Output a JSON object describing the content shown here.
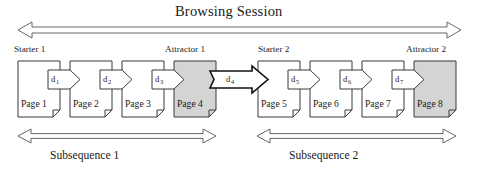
{
  "diagram": {
    "title": "Browsing Session",
    "session_arrow": {
      "name": "browsing-session-span-arrow",
      "direction": "double",
      "x1": 18,
      "x2": 461,
      "y": 30
    },
    "style": {
      "stroke": "#3a3a3a",
      "fill_plain": "#ffffff",
      "fill_shaded": "#d4d4d4",
      "bold_stroke": "#111111"
    },
    "role_labels": [
      {
        "name": "starter-1-label",
        "text": "Starter 1",
        "x": 14,
        "y": 46
      },
      {
        "name": "attractor-1-label",
        "text": "Attractor 1",
        "x": 168,
        "y": 46
      },
      {
        "name": "starter-2-label",
        "text": "Starter 2",
        "x": 259,
        "y": 46
      },
      {
        "name": "attractor-2-label",
        "text": "Attractor 2",
        "x": 411,
        "y": 46
      }
    ],
    "pages": [
      {
        "name": "page-node-1",
        "label": "Page 1",
        "x": 18,
        "y": 61,
        "w": 42,
        "h": 56,
        "shaded": false,
        "role": "Starter 1"
      },
      {
        "name": "page-node-2",
        "label": "Page 2",
        "x": 70,
        "y": 61,
        "w": 42,
        "h": 56,
        "shaded": false,
        "role": ""
      },
      {
        "name": "page-node-3",
        "label": "Page 3",
        "x": 122,
        "y": 61,
        "w": 42,
        "h": 56,
        "shaded": false,
        "role": ""
      },
      {
        "name": "page-node-4",
        "label": "Page 4",
        "x": 174,
        "y": 61,
        "w": 42,
        "h": 56,
        "shaded": true,
        "role": "Attractor 1"
      },
      {
        "name": "page-node-5",
        "label": "Page 5",
        "x": 258,
        "y": 61,
        "w": 42,
        "h": 56,
        "shaded": false,
        "role": "Starter 2"
      },
      {
        "name": "page-node-6",
        "label": "Page 6",
        "x": 310,
        "y": 61,
        "w": 42,
        "h": 56,
        "shaded": false,
        "role": ""
      },
      {
        "name": "page-node-7",
        "label": "Page 7",
        "x": 362,
        "y": 61,
        "w": 42,
        "h": 56,
        "shaded": false,
        "role": ""
      },
      {
        "name": "page-node-8",
        "label": "Page 8",
        "x": 414,
        "y": 61,
        "w": 42,
        "h": 56,
        "shaded": true,
        "role": "Attractor 2"
      }
    ],
    "transitions": [
      {
        "name": "transition-d1",
        "label": "d",
        "sub": "1",
        "x": 48,
        "y": 70,
        "w": 32,
        "h": 19,
        "bold": false
      },
      {
        "name": "transition-d2",
        "label": "d",
        "sub": "2",
        "x": 100,
        "y": 70,
        "w": 32,
        "h": 19,
        "bold": false
      },
      {
        "name": "transition-d3",
        "label": "d",
        "sub": "3",
        "x": 152,
        "y": 70,
        "w": 32,
        "h": 19,
        "bold": false
      },
      {
        "name": "transition-d4",
        "label": "d",
        "sub": "4",
        "x": 210,
        "y": 68,
        "w": 58,
        "h": 25,
        "bold": true
      },
      {
        "name": "transition-d5",
        "label": "d",
        "sub": "5",
        "x": 288,
        "y": 70,
        "w": 32,
        "h": 19,
        "bold": false
      },
      {
        "name": "transition-d6",
        "label": "d",
        "sub": "6",
        "x": 340,
        "y": 70,
        "w": 32,
        "h": 19,
        "bold": false
      },
      {
        "name": "transition-d7",
        "label": "d",
        "sub": "7",
        "x": 392,
        "y": 70,
        "w": 32,
        "h": 19,
        "bold": false
      }
    ],
    "subsequences": [
      {
        "name": "subsequence-1",
        "label": "Subsequence 1",
        "arrow_x1": 18,
        "arrow_x2": 216,
        "arrow_y": 136,
        "label_x": 73,
        "label_y": 152
      },
      {
        "name": "subsequence-2",
        "label": "Subsequence 2",
        "arrow_x1": 257,
        "arrow_x2": 456,
        "arrow_y": 136,
        "label_x": 311,
        "label_y": 152
      }
    ]
  }
}
